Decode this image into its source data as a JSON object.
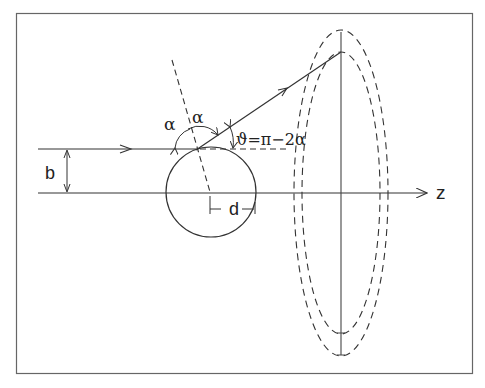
{
  "figure": {
    "title": "",
    "labels": {
      "impact_parameter": "b",
      "distance": "d",
      "axis": "z",
      "alpha_left": "α",
      "alpha_right": "α",
      "scattering_angle": "ϑ=π−2α"
    },
    "elements": [
      "incoming ray at height b above axis",
      "z axis with arrow",
      "sphere (circle) centered on axis",
      "dashed surface normal through point of reflection",
      "reflected ray at angle ϑ",
      "two dashed ellipses (detector surfaces)",
      "vertical line at detector plane"
    ],
    "colors": {
      "line": "#333333",
      "frame": "#555555",
      "background": "#ffffff"
    }
  }
}
